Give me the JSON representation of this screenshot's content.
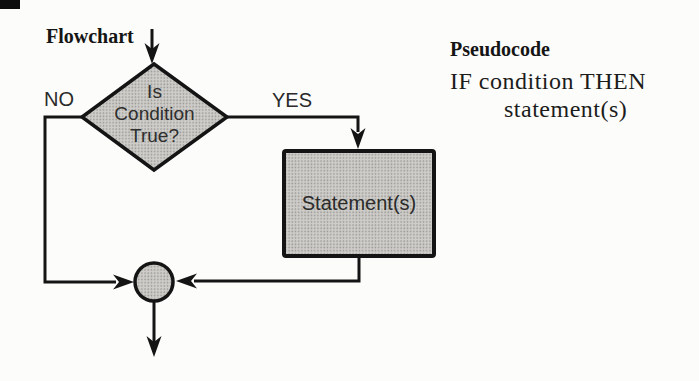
{
  "titles": {
    "flowchart": "Flowchart",
    "pseudocode": "Pseudocode"
  },
  "flowchart": {
    "decision_lines": [
      "Is",
      "Condition",
      "True?"
    ],
    "branch_no": "NO",
    "branch_yes": "YES",
    "process": "Statement(s)"
  },
  "pseudocode": {
    "line1": "IF condition THEN",
    "line2": "statement(s)"
  },
  "colors": {
    "paper": "#fcfcfa",
    "ink": "#141414",
    "shape_fill_base": "#cecdc9",
    "shape_fill_dot": "#9b9a96"
  }
}
